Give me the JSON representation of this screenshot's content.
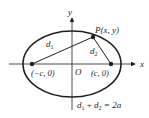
{
  "diagram": {
    "axes": {
      "x_label": "x",
      "y_label": "y",
      "origin_label": "O"
    },
    "point": {
      "label": "P(x, y)"
    },
    "foci": [
      {
        "label": "(−c, 0)"
      },
      {
        "label": "(c, 0)"
      }
    ],
    "distances": [
      {
        "label": "d",
        "sub": "1"
      },
      {
        "label": "d",
        "sub": "2"
      }
    ],
    "equation": {
      "d1": "d",
      "s1": "1",
      "plus": " + ",
      "d2": "d",
      "s2": "2",
      "rhs": " = 2a"
    },
    "colors": {
      "stroke": "#231f20",
      "background": "#ffffff"
    }
  }
}
